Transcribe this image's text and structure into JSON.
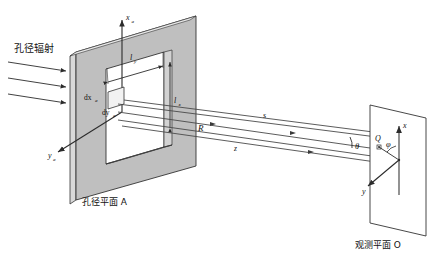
{
  "figure": {
    "title_left": "孔径辐射",
    "caption_aperture": "孔径平面 A",
    "caption_observation": "观测平面 O"
  },
  "aperture_plane": {
    "axis_x": "x",
    "axis_x_sub": "a",
    "axis_y": "y",
    "axis_y_sub": "a",
    "dim_ly": "l",
    "dim_ly_sub": "y",
    "dim_lx": "l",
    "dim_lx_sub": "x",
    "elem_dx": "dx",
    "elem_dx_sub": "a",
    "elem_dy": "dy",
    "elem_dy_sub": "a",
    "fill_color": "#bfbfbf",
    "edge_color": "#333333",
    "aperture_fill": "#ffffff"
  },
  "rays": {
    "s_label": "s",
    "r_label": "R",
    "z_label": "z",
    "theta_label": "θ",
    "line_color": "#3a3a3a"
  },
  "observation_plane": {
    "axis_x": "x",
    "axis_y": "y",
    "point_label": "Q",
    "phi_label": "φ",
    "fill_color": "#ffffff",
    "edge_color": "#333333"
  },
  "incident_arrows": {
    "count": 3,
    "color": "#2b2b2b"
  }
}
